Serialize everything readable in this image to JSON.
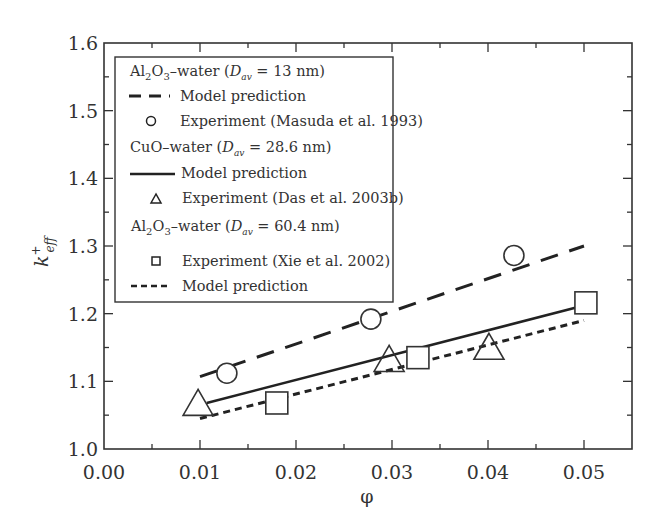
{
  "chart_data": {
    "type": "scatter",
    "title": "",
    "xlabel": "φ",
    "ylabel": "k+eff",
    "xlim": [
      0.0,
      0.055
    ],
    "ylim": [
      1.0,
      1.6
    ],
    "x_ticks": [
      "0.00",
      "0.01",
      "0.02",
      "0.03",
      "0.04",
      "0.05"
    ],
    "y_ticks": [
      "1.0",
      "1.1",
      "1.2",
      "1.3",
      "1.4",
      "1.5",
      "1.6"
    ],
    "grid": false,
    "legend_position": "upper left (inside)",
    "series": [
      {
        "name": "Al2O3–water (Dav = 13 nm) Model prediction",
        "kind": "line",
        "style": "long-dash",
        "x": [
          0.01,
          0.05
        ],
        "y": [
          1.107,
          1.3
        ]
      },
      {
        "name": "Al2O3–water (Dav = 13 nm) Experiment (Masuda et al. 1993)",
        "kind": "marker",
        "marker": "circle",
        "x": [
          0.0128,
          0.0278,
          0.0427
        ],
        "y": [
          1.112,
          1.192,
          1.286
        ]
      },
      {
        "name": "CuO–water (Dav = 28.6 nm) Model prediction",
        "kind": "line",
        "style": "solid",
        "x": [
          0.0107,
          0.05
        ],
        "y": [
          1.068,
          1.212
        ]
      },
      {
        "name": "CuO–water (Dav = 28.6 nm) Experiment (Das et al. 2003b)",
        "kind": "marker",
        "marker": "triangle",
        "x": [
          0.0098,
          0.0297,
          0.0401
        ],
        "y": [
          1.065,
          1.13,
          1.148
        ]
      },
      {
        "name": "Al2O3–water (Dav = 60.4 nm) Experiment (Xie et al. 2002)",
        "kind": "marker",
        "marker": "square",
        "x": [
          0.018,
          0.0327,
          0.0502
        ],
        "y": [
          1.068,
          1.135,
          1.216
        ]
      },
      {
        "name": "Al2O3–water (Dav = 60.4 nm) Model prediction",
        "kind": "line",
        "style": "short-dash",
        "x": [
          0.01,
          0.05
        ],
        "y": [
          1.045,
          1.19
        ]
      }
    ]
  },
  "axes": {
    "x_label": "φ",
    "y_label_main": "k",
    "y_label_sup": "+",
    "y_label_sub": "eff"
  },
  "legend": {
    "group1": {
      "prefix": "Al",
      "sub1": "2",
      "mid": "O",
      "sub2": "3",
      "suffix": "–water (",
      "dvar": "D",
      "dsub": "av",
      "dval": " = 13 nm)"
    },
    "group1_model": "Model prediction",
    "group1_exp": "Experiment (Masuda et al. 1993)",
    "group2": {
      "prefix": "CuO–water (",
      "dvar": "D",
      "dsub": "av",
      "dval": " = 28.6 nm)"
    },
    "group2_model": "Model prediction",
    "group2_exp": "Experiment (Das et al. 2003b)",
    "group3": {
      "prefix": "Al",
      "sub1": "2",
      "mid": "O",
      "sub2": "3",
      "suffix": "–water (",
      "dvar": "D",
      "dsub": "av",
      "dval": " = 60.4 nm)"
    },
    "group3_exp": "Experiment (Xie et al. 2002)",
    "group3_model": "Model prediction"
  },
  "colors": {
    "ink": "#333333",
    "background": "#ffffff"
  }
}
